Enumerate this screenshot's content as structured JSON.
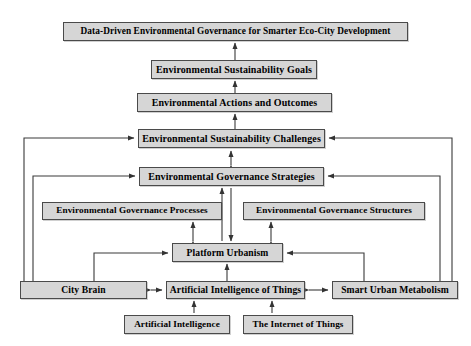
{
  "diagram": {
    "type": "flow-hierarchy",
    "background_color": "#ffffff",
    "node_fill_color": "#d6d6d6",
    "node_border_color": "#4a4a4a",
    "connector_color": "#404040",
    "nodes": [
      {
        "id": "top",
        "label": "Data-Driven Environmental Governance for Smarter Eco-City Development",
        "x": 63,
        "y": 22,
        "w": 345,
        "h": 19
      },
      {
        "id": "goals",
        "label": "Environmental Sustainability Goals",
        "x": 151,
        "y": 60,
        "w": 166,
        "h": 19
      },
      {
        "id": "actions",
        "label": "Environmental  Actions and Outcomes",
        "x": 137,
        "y": 93,
        "w": 195,
        "h": 19
      },
      {
        "id": "chall",
        "label": "Environmental Sustainability Challenges",
        "x": 138,
        "y": 129,
        "w": 187,
        "h": 19
      },
      {
        "id": "strat",
        "label": "Environmental Governance Strategies",
        "x": 139,
        "y": 167,
        "w": 185,
        "h": 19
      },
      {
        "id": "proc",
        "label": "Environmental Governance Processes",
        "x": 42,
        "y": 202,
        "w": 180,
        "h": 18
      },
      {
        "id": "struct",
        "label": "Environmental Governance Structures",
        "x": 243,
        "y": 202,
        "w": 182,
        "h": 18
      },
      {
        "id": "plat",
        "label": "Platform Urbanism",
        "x": 172,
        "y": 243,
        "w": 111,
        "h": 19
      },
      {
        "id": "city",
        "label": "City Brain",
        "x": 20,
        "y": 281,
        "w": 127,
        "h": 18
      },
      {
        "id": "aiot",
        "label": "Artificial Intelligence of Things",
        "x": 166,
        "y": 281,
        "w": 139,
        "h": 18
      },
      {
        "id": "sum",
        "label": "Smart Urban Metabolism",
        "x": 332,
        "y": 281,
        "w": 126,
        "h": 18
      },
      {
        "id": "ai",
        "label": "Artificial Intelligence",
        "x": 124,
        "y": 315,
        "w": 106,
        "h": 19
      },
      {
        "id": "iot",
        "label": "The Internet of Things",
        "x": 243,
        "y": 315,
        "w": 110,
        "h": 19
      }
    ],
    "edges": [
      {
        "from": "goals",
        "to": "top",
        "style": "single-arrow-up"
      },
      {
        "from": "actions",
        "to": "goals",
        "style": "single-arrow-up"
      },
      {
        "from": "chall",
        "to": "actions",
        "style": "single-arrow-up"
      },
      {
        "from": "strat",
        "to": "chall",
        "style": "double-arrow-vertical"
      },
      {
        "from": "plat",
        "to": "strat",
        "style": "single-arrow-up"
      },
      {
        "from": "plat",
        "to": "proc",
        "style": "double-arrow-vertical"
      },
      {
        "from": "plat",
        "to": "struct",
        "style": "double-arrow-vertical"
      },
      {
        "from": "strat",
        "to": "plat",
        "style": "single-arrow-down-bypass"
      },
      {
        "from": "aiot",
        "to": "plat",
        "style": "single-arrow-up"
      },
      {
        "from": "city",
        "to": "aiot",
        "style": "double-arrow-horizontal"
      },
      {
        "from": "aiot",
        "to": "sum",
        "style": "double-arrow-horizontal"
      },
      {
        "from": "ai",
        "to": "aiot",
        "style": "single-arrow-up"
      },
      {
        "from": "iot",
        "to": "aiot",
        "style": "single-arrow-up"
      },
      {
        "from": "city",
        "to": "chall",
        "style": "elbow-left-outer"
      },
      {
        "from": "city",
        "to": "strat",
        "style": "elbow-left-inner"
      },
      {
        "from": "city",
        "to": "plat",
        "style": "elbow-left-short"
      },
      {
        "from": "sum",
        "to": "chall",
        "style": "elbow-right-outer"
      },
      {
        "from": "sum",
        "to": "strat",
        "style": "elbow-right-inner"
      },
      {
        "from": "sum",
        "to": "plat",
        "style": "elbow-right-short"
      }
    ]
  }
}
